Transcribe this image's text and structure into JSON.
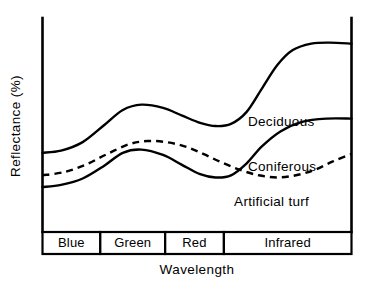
{
  "chart_data": {
    "type": "line",
    "title": "",
    "xlabel": "Wavelength",
    "ylabel": "Reflectance  (%)",
    "grid": false,
    "legend_position": "inline-curve-labels",
    "xlim": [
      0,
      100
    ],
    "ylim": [
      0,
      100
    ],
    "x_axis_bands": [
      {
        "label": "Blue",
        "start": 0,
        "end": 18.7
      },
      {
        "label": "Green",
        "start": 18.7,
        "end": 39.7
      },
      {
        "label": "Red",
        "start": 39.7,
        "end": 58.7
      },
      {
        "label": "Infrared",
        "start": 58.7,
        "end": 100
      }
    ],
    "series": [
      {
        "name": "Deciduous",
        "style": "solid",
        "label_x": 66.5,
        "label_y": 49.5,
        "x": [
          0,
          6,
          13,
          20,
          26,
          32,
          39,
          45,
          51,
          56,
          61,
          66,
          71,
          76,
          81,
          87,
          93,
          100
        ],
        "y": [
          37,
          38,
          42,
          50,
          57,
          59.5,
          58,
          54.5,
          51,
          49.5,
          50.5,
          56,
          67,
          78,
          85,
          88,
          88.5,
          88
        ]
      },
      {
        "name": "Coniferous",
        "style": "solid",
        "label_x": 66.5,
        "label_y": 28.5,
        "x": [
          0,
          6,
          13,
          20,
          26,
          32,
          39,
          45,
          51,
          56,
          61,
          66,
          71,
          77,
          84,
          92,
          100
        ],
        "y": [
          21,
          22,
          25,
          31,
          37,
          38.5,
          36,
          31.5,
          27,
          25.5,
          26.5,
          32,
          40,
          47,
          51.5,
          53,
          53
        ]
      },
      {
        "name": "Artificial turf",
        "style": "dashed",
        "label_x": 62,
        "label_y": 12,
        "x": [
          0,
          7,
          14,
          21,
          28,
          34,
          40,
          46,
          52,
          58,
          64,
          70,
          76,
          82,
          88,
          94,
          100
        ],
        "y": [
          26.5,
          28,
          31.5,
          36.5,
          41,
          42.5,
          42,
          40,
          36.5,
          32.5,
          29,
          26.5,
          25.5,
          26.5,
          29,
          33,
          36.5
        ]
      }
    ]
  },
  "labels": {
    "y_axis_title": "Reflectance  (%)",
    "x_axis_title": "Wavelength",
    "band_blue": "Blue",
    "band_green": "Green",
    "band_red": "Red",
    "band_infrared": "Infrared",
    "series_deciduous": "Deciduous",
    "series_coniferous": "Coniferous",
    "series_artificial_turf": "Artificial turf"
  },
  "colors": {
    "ink": "#000000",
    "paper": "#ffffff"
  }
}
